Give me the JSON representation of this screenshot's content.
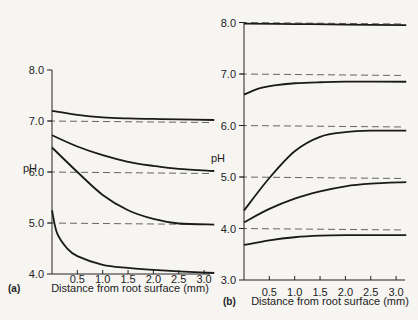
{
  "chart_data": [
    {
      "panel": "(a)",
      "type": "line",
      "xlabel": "Distance from root surface (mm)",
      "ylabel": "pH",
      "xlim": [
        0,
        3.2
      ],
      "ylim": [
        4.0,
        8.0
      ],
      "xticks": [
        "0.5",
        "1.0",
        "1.5",
        "2.0",
        "2.5",
        "3.0"
      ],
      "yticks": [
        "4.0",
        "5.0",
        "6.0",
        "7.0",
        "8.0"
      ],
      "reference_lines": [
        7.0,
        6.0,
        5.0
      ],
      "series": [
        {
          "name": "bulk pH 7.0",
          "x": [
            0,
            0.5,
            1.0,
            1.5,
            2.0,
            2.5,
            3.2
          ],
          "values": [
            7.2,
            7.12,
            7.07,
            7.05,
            7.04,
            7.03,
            7.02
          ]
        },
        {
          "name": "bulk pH 6.0",
          "x": [
            0,
            0.5,
            1.0,
            1.5,
            2.0,
            2.5,
            3.2
          ],
          "values": [
            6.72,
            6.5,
            6.33,
            6.2,
            6.12,
            6.06,
            6.02
          ]
        },
        {
          "name": "bulk pH 5.0",
          "x": [
            0,
            0.5,
            1.0,
            1.5,
            2.0,
            2.5,
            3.2
          ],
          "values": [
            6.48,
            6.0,
            5.55,
            5.25,
            5.08,
            4.99,
            4.97
          ]
        },
        {
          "name": "bulk pH 4.0",
          "x": [
            0,
            0.1,
            0.3,
            0.5,
            1.0,
            1.5,
            2.0,
            2.5,
            3.2
          ],
          "values": [
            5.25,
            4.8,
            4.5,
            4.35,
            4.18,
            4.12,
            4.08,
            4.05,
            4.02
          ]
        }
      ]
    },
    {
      "panel": "(b)",
      "type": "line",
      "xlabel": "Distance from root surface (mm)",
      "ylabel": "pH",
      "xlim": [
        0,
        3.2
      ],
      "ylim": [
        3.0,
        8.0
      ],
      "xticks": [
        "0.5",
        "1.0",
        "1.5",
        "2.0",
        "2.5",
        "3.0"
      ],
      "yticks": [
        "3.0",
        "4.0",
        "5.0",
        "6.0",
        "7.0",
        "8.0"
      ],
      "reference_lines": [
        8.0,
        7.0,
        6.0,
        5.0,
        4.0
      ],
      "series": [
        {
          "name": "bulk pH 8.0",
          "x": [
            0,
            1.0,
            2.0,
            3.2
          ],
          "values": [
            7.98,
            7.97,
            7.96,
            7.95
          ]
        },
        {
          "name": "bulk pH 7.0",
          "x": [
            0,
            0.3,
            0.6,
            1.0,
            1.5,
            2.0,
            3.2
          ],
          "values": [
            6.6,
            6.72,
            6.78,
            6.82,
            6.84,
            6.85,
            6.85
          ]
        },
        {
          "name": "bulk pH 6.0",
          "x": [
            0,
            0.5,
            1.0,
            1.5,
            2.0,
            2.5,
            3.2
          ],
          "values": [
            4.35,
            4.98,
            5.5,
            5.78,
            5.87,
            5.9,
            5.9
          ]
        },
        {
          "name": "bulk pH 5.0",
          "x": [
            0,
            0.5,
            1.0,
            1.5,
            2.0,
            2.5,
            3.2
          ],
          "values": [
            4.12,
            4.38,
            4.58,
            4.72,
            4.82,
            4.87,
            4.9
          ]
        },
        {
          "name": "bulk pH 4.0",
          "x": [
            0,
            0.5,
            1.0,
            1.5,
            2.0,
            2.5,
            3.2
          ],
          "values": [
            3.68,
            3.77,
            3.83,
            3.86,
            3.87,
            3.87,
            3.87
          ]
        }
      ]
    }
  ]
}
